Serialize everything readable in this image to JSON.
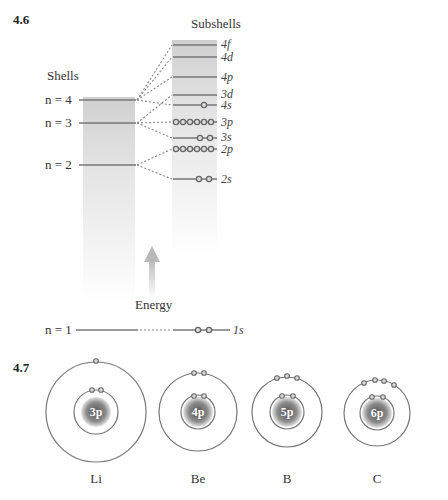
{
  "figure_46": {
    "number": "4.6",
    "shells_title": "Shells",
    "subshells_title": "Subshells",
    "energy_label": "Energy",
    "shells": [
      {
        "label": "n = 4",
        "y": 100
      },
      {
        "label": "n = 3",
        "y": 123
      },
      {
        "label": "n = 2",
        "y": 165
      },
      {
        "label": "n = 1",
        "y": 330
      }
    ],
    "subshells": [
      {
        "name": "4f",
        "y": 45,
        "electrons": 0
      },
      {
        "name": "4d",
        "y": 57,
        "electrons": 0
      },
      {
        "name": "4p",
        "y": 77,
        "electrons": 0
      },
      {
        "name": "3d",
        "y": 95,
        "electrons": 0
      },
      {
        "name": "4s",
        "y": 105,
        "electrons": 1
      },
      {
        "name": "3p",
        "y": 122,
        "electrons": 6
      },
      {
        "name": "3s",
        "y": 138,
        "electrons": 2
      },
      {
        "name": "2p",
        "y": 149,
        "electrons": 6
      },
      {
        "name": "2s",
        "y": 179,
        "electrons": 2
      },
      {
        "name": "1s",
        "y": 330,
        "electrons": 2
      }
    ]
  },
  "figure_47": {
    "number": "4.7",
    "atoms": [
      {
        "symbol": "Li",
        "nucleus": "3p",
        "inner_electrons": 2,
        "outer_electrons": 1
      },
      {
        "symbol": "Be",
        "nucleus": "4p",
        "inner_electrons": 2,
        "outer_electrons": 2
      },
      {
        "symbol": "B",
        "nucleus": "5p",
        "inner_electrons": 2,
        "outer_electrons": 3
      },
      {
        "symbol": "C",
        "nucleus": "6p",
        "inner_electrons": 2,
        "outer_electrons": 4
      }
    ]
  }
}
